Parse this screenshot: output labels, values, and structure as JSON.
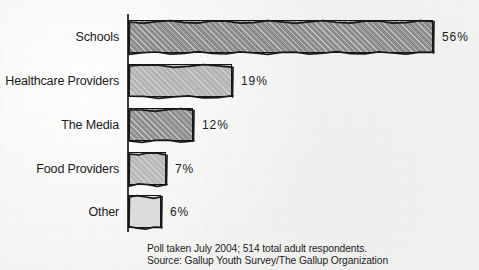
{
  "chart_data": {
    "type": "bar",
    "orientation": "horizontal",
    "title": "",
    "subtitle": "",
    "xlabel": "",
    "ylabel": "",
    "xlim": [
      0,
      56
    ],
    "grid": false,
    "legend": null,
    "categories": [
      "Schools",
      "Healthcare Providers",
      "The Media",
      "Food Providers",
      "Other"
    ],
    "values": [
      56,
      19,
      12,
      7,
      6
    ],
    "value_labels": [
      "56%",
      "19%",
      "12%",
      "7%",
      "6%"
    ],
    "bars": [
      {
        "category": "Schools",
        "value": 56,
        "label": "56%",
        "fill": "#8c8c8c",
        "hatch": "diagonal"
      },
      {
        "category": "Healthcare Providers",
        "value": 19,
        "label": "19%",
        "fill": "#b4b4b4",
        "hatch": "diagonal"
      },
      {
        "category": "The Media",
        "value": 12,
        "label": "12%",
        "fill": "#8f8f8f",
        "hatch": "diagonal"
      },
      {
        "category": "Food Providers",
        "value": 7,
        "label": "7%",
        "fill": "#b8b8b8",
        "hatch": "diagonal"
      },
      {
        "category": "Other",
        "value": 6,
        "label": "6%",
        "fill": "#dcdcdc",
        "hatch": "none"
      }
    ]
  },
  "footnote": {
    "line1": "Poll taken July 2004; 514 total adult respondents.",
    "line2": "Source: Gallup Youth Survey/The Gallup Organization"
  },
  "colors": {
    "background": "#f2f2f0",
    "axis": "#3a3a3a",
    "text": "#1b1b1b",
    "bar_outline": "#1a1a1a"
  }
}
